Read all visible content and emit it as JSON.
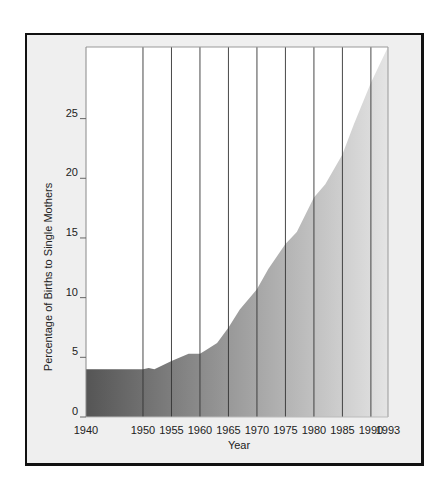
{
  "chart_data": {
    "type": "area",
    "title": "",
    "xlabel": "Year",
    "ylabel": "Percentage of Births to Single Mothers",
    "xlim": [
      1940,
      1993
    ],
    "ylim": [
      0,
      31
    ],
    "x_ticks": [
      1940,
      1950,
      1955,
      1960,
      1965,
      1970,
      1975,
      1980,
      1985,
      1990,
      1993
    ],
    "x_tick_labels": [
      "1940",
      "1950",
      "1955",
      "1960",
      "1965",
      "1970",
      "1975",
      "1980",
      "1985",
      "1990",
      "1993"
    ],
    "y_ticks": [
      0,
      5,
      10,
      15,
      20,
      25
    ],
    "y_tick_labels": [
      "0",
      "5",
      "10",
      "15",
      "20",
      "25"
    ],
    "vertical_gridlines": [
      1950,
      1955,
      1960,
      1965,
      1970,
      1975,
      1980,
      1985,
      1990
    ],
    "grid": true,
    "legend": "none",
    "series": [
      {
        "name": "Percentage of births to single mothers",
        "x": [
          1940,
          1950,
          1951,
          1952,
          1955,
          1958,
          1960,
          1961,
          1963,
          1965,
          1967,
          1970,
          1972,
          1975,
          1977,
          1980,
          1982,
          1985,
          1987,
          1990,
          1993
        ],
        "values": [
          4.0,
          4.0,
          4.1,
          4.0,
          4.7,
          5.3,
          5.3,
          5.6,
          6.2,
          7.5,
          9.0,
          10.7,
          12.4,
          14.5,
          15.5,
          18.4,
          19.5,
          22.0,
          24.5,
          28.0,
          31.0
        ]
      }
    ],
    "fill_gradient": [
      "#555555",
      "#e4e4e4"
    ]
  }
}
